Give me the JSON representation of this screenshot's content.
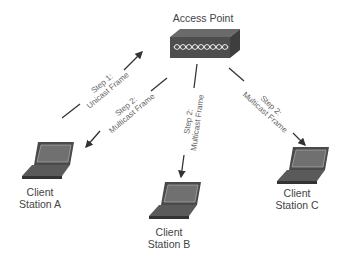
{
  "diagram": {
    "access_point": {
      "label": "Access Point",
      "icon": "access-point-icon"
    },
    "clients": [
      {
        "line1": "Client",
        "line2": "Station A",
        "icon": "laptop-icon"
      },
      {
        "line1": "Client",
        "line2": "Station B",
        "icon": "laptop-icon"
      },
      {
        "line1": "Client",
        "line2": "Station C",
        "icon": "laptop-icon"
      }
    ],
    "arrows": [
      {
        "from": "Client Station A",
        "to": "Access Point",
        "line1": "Step 1:",
        "line2": "Unicast Frame"
      },
      {
        "from": "Access Point",
        "to": "Client Station A",
        "line1": "Step 2:",
        "line2": "Multicast Frame"
      },
      {
        "from": "Access Point",
        "to": "Client Station B",
        "line1": "Step 2:",
        "line2": "Multicast Frame"
      },
      {
        "from": "Access Point",
        "to": "Client Station C",
        "line1": "Step 2:",
        "line2": "Multicast Frame"
      }
    ],
    "colors": {
      "line": "#333333",
      "device": "#555555",
      "device_dark": "#3a3a3a",
      "text": "#444444"
    }
  }
}
